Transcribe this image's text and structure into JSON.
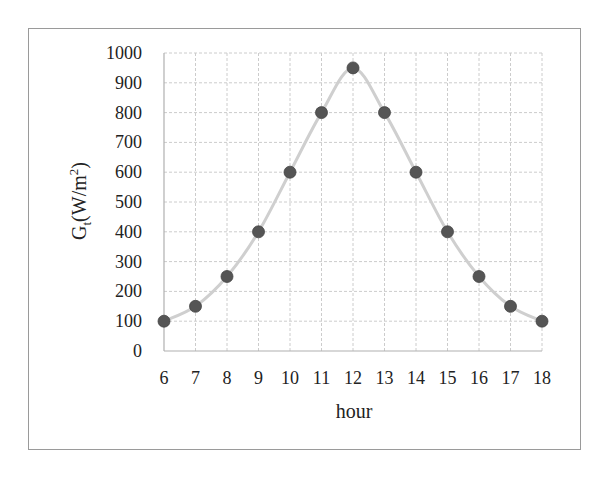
{
  "chart_data": {
    "type": "line",
    "title": "",
    "xlabel": "hour",
    "ylabel": "Gt(W/m2)",
    "ylabel_parts": {
      "main": "G",
      "sub": "t",
      "unit_open": "(W/m",
      "sup": "2",
      "unit_close": ")"
    },
    "x": [
      6,
      7,
      8,
      9,
      10,
      11,
      12,
      13,
      14,
      15,
      16,
      17,
      18
    ],
    "series": [
      {
        "name": "Gt",
        "values": [
          100,
          150,
          250,
          400,
          600,
          800,
          950,
          800,
          600,
          400,
          250,
          150,
          100
        ]
      }
    ],
    "xlim": [
      6,
      18
    ],
    "ylim": [
      0,
      1000
    ],
    "xticks": [
      "6",
      "7",
      "8",
      "9",
      "10",
      "11",
      "12",
      "13",
      "14",
      "15",
      "16",
      "17",
      "18"
    ],
    "yticks": [
      "0",
      "100",
      "200",
      "300",
      "400",
      "500",
      "600",
      "700",
      "800",
      "900",
      "1000"
    ],
    "grid": true,
    "legend": null,
    "line_color": "#cfcfcf",
    "marker_color": "#555555",
    "smooth": true
  }
}
